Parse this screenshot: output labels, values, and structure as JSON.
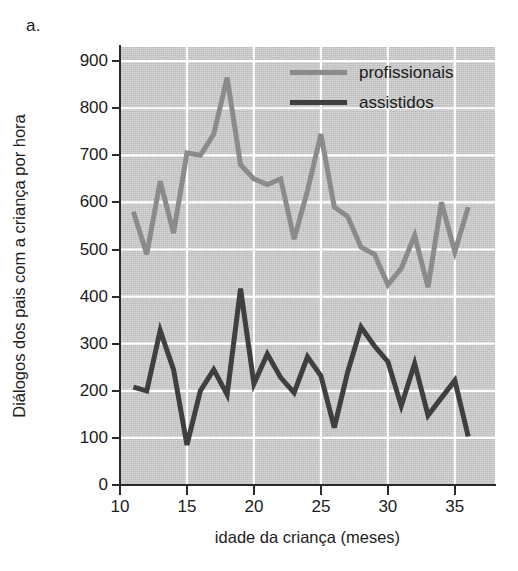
{
  "panel": {
    "label": "a."
  },
  "axes": {
    "y_title": "Diálogos dos pais com a criança por hora",
    "x_title": "idade da criança (meses)",
    "y_ticks": [
      "900",
      "800",
      "700",
      "600",
      "500",
      "400",
      "300",
      "200",
      "100",
      "0"
    ],
    "x_ticks": [
      "10",
      "15",
      "20",
      "25",
      "30",
      "35"
    ]
  },
  "legend": {
    "items": [
      {
        "label": "profissionais",
        "color": "#8b8b8b"
      },
      {
        "label": "assistidos",
        "color": "#3f3f3f"
      }
    ]
  },
  "colors": {
    "plot_background": "#c9c9c9",
    "gridline": "#ffffff",
    "axis": "#2a2a2a",
    "series_profissionais": "#8b8b8b",
    "series_assistidos": "#3f3f3f"
  },
  "chart_data": {
    "type": "line",
    "title": "",
    "subtitle": "",
    "xlabel": "idade da criança (meses)",
    "ylabel": "Diálogos dos pais com a criança por hora",
    "xlim": [
      10,
      38
    ],
    "ylim": [
      0,
      930
    ],
    "xticks": [
      10,
      15,
      20,
      25,
      30,
      35
    ],
    "yticks": [
      0,
      100,
      200,
      300,
      400,
      500,
      600,
      700,
      800,
      900
    ],
    "grid": true,
    "grid_color": "#ffffff",
    "legend_position": "top-right",
    "x": [
      11,
      12,
      13,
      14,
      15,
      16,
      17,
      18,
      19,
      20,
      21,
      22,
      23,
      24,
      25,
      26,
      27,
      28,
      29,
      30,
      31,
      32,
      33,
      34,
      35,
      36
    ],
    "series": [
      {
        "name": "profissionais",
        "color": "#8b8b8b",
        "values": [
          580,
          490,
          645,
          535,
          705,
          700,
          745,
          865,
          680,
          650,
          638,
          650,
          522,
          625,
          745,
          590,
          570,
          505,
          490,
          425,
          460,
          530,
          420,
          600,
          495,
          590
        ]
      },
      {
        "name": "assistidos",
        "color": "#3f3f3f",
        "values": [
          208,
          200,
          328,
          245,
          85,
          200,
          245,
          192,
          417,
          215,
          278,
          228,
          196,
          272,
          232,
          122,
          240,
          335,
          295,
          262,
          168,
          258,
          148,
          185,
          222,
          103
        ]
      }
    ]
  }
}
